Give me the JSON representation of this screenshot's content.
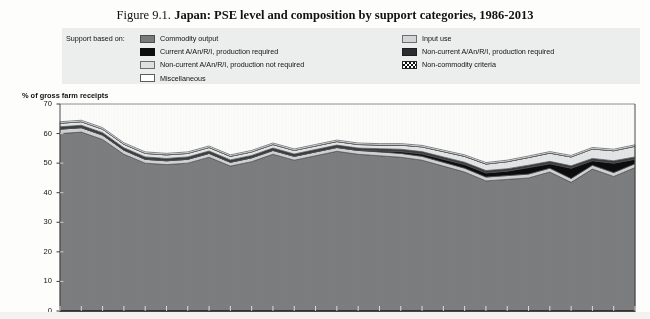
{
  "title": {
    "figure_number": "Figure 9.1.",
    "text": "Japan: PSE level and composition by support categories, 1986-2013"
  },
  "legend": {
    "lead_label": "Support based on:",
    "left_items": [
      {
        "label": "Commodity output",
        "swatch": "dark-gray-fill",
        "color": "#77797a"
      },
      {
        "label": "Current A/An/R/I, production required",
        "swatch": "black-fill",
        "color": "#0d0d0d"
      },
      {
        "label": "Non-current A/An/R/I, production not required",
        "swatch": "light-gray-fill",
        "color": "#dedfe0"
      },
      {
        "label": "Miscellaneous",
        "swatch": "white-fill",
        "color": "#ffffff"
      }
    ],
    "right_items": [
      {
        "label": "Input use",
        "swatch": "light-gray-fill",
        "color": "#d3d5d6"
      },
      {
        "label": "Non-current A/An/R/I, production required",
        "swatch": "very-dark-fill",
        "color": "#2b2d2e"
      },
      {
        "label": "Non-commodity criteria",
        "swatch": "hatched-fill",
        "color": "#ffffff"
      }
    ]
  },
  "axis": {
    "y_label": "% of gross farm receipts",
    "y_ticks": [
      "70",
      "60",
      "50",
      "40",
      "30",
      "20",
      "10",
      "0"
    ]
  },
  "chart_data": {
    "type": "area",
    "title": "Japan: PSE level and composition by support categories, 1986-2013",
    "xlabel": "",
    "ylabel": "% of gross farm receipts",
    "ylim": [
      0,
      70
    ],
    "grid": false,
    "legend_position": "top",
    "stacked": true,
    "x": [
      1986,
      1987,
      1988,
      1989,
      1990,
      1991,
      1992,
      1993,
      1994,
      1995,
      1996,
      1997,
      1998,
      1999,
      2000,
      2001,
      2002,
      2003,
      2004,
      2005,
      2006,
      2007,
      2008,
      2009,
      2010,
      2011,
      2012,
      2013
    ],
    "series": [
      {
        "name": "Commodity output",
        "values": [
          60.0,
          60.5,
          58.0,
          53.0,
          50.0,
          49.5,
          50.0,
          52.0,
          49.0,
          50.5,
          53.0,
          51.0,
          52.5,
          54.0,
          53.0,
          52.5,
          52.0,
          51.0,
          49.0,
          47.0,
          44.0,
          44.5,
          45.0,
          47.0,
          43.5,
          48.0,
          45.5,
          48.5
        ]
      },
      {
        "name": "Input use",
        "values": [
          1.5,
          1.5,
          1.5,
          1.4,
          1.3,
          1.3,
          1.3,
          1.3,
          1.3,
          1.3,
          1.3,
          1.3,
          1.3,
          1.3,
          1.3,
          1.3,
          1.3,
          1.3,
          1.3,
          1.3,
          1.3,
          1.3,
          1.3,
          1.3,
          1.3,
          1.3,
          1.3,
          1.3
        ]
      },
      {
        "name": "Current A/An/R/I, production required",
        "values": [
          0.0,
          0.0,
          0.0,
          0.0,
          0.0,
          0.0,
          0.0,
          0.0,
          0.0,
          0.0,
          0.0,
          0.0,
          0.0,
          0.0,
          0.0,
          0.3,
          0.6,
          0.8,
          1.0,
          1.2,
          1.4,
          1.5,
          2.2,
          1.5,
          3.5,
          1.5,
          3.2,
          1.5
        ]
      },
      {
        "name": "Non-current A/An/R/I, production required",
        "values": [
          0.8,
          0.8,
          0.8,
          0.8,
          0.8,
          0.8,
          0.8,
          0.8,
          0.8,
          0.8,
          0.8,
          0.8,
          0.8,
          0.8,
          0.8,
          0.8,
          0.8,
          0.8,
          0.8,
          0.8,
          0.8,
          0.8,
          0.8,
          0.8,
          0.8,
          0.8,
          0.8,
          0.8
        ]
      },
      {
        "name": "Non-current A/An/R/I, production not required",
        "values": [
          1.2,
          1.2,
          1.2,
          1.2,
          1.2,
          1.2,
          1.2,
          1.2,
          1.2,
          1.2,
          1.2,
          1.2,
          1.2,
          1.2,
          1.2,
          1.2,
          1.4,
          1.6,
          1.8,
          2.0,
          2.2,
          2.4,
          2.6,
          2.8,
          3.0,
          3.2,
          3.4,
          3.6
        ]
      },
      {
        "name": "Non-commodity criteria",
        "values": [
          0.0,
          0.0,
          0.0,
          0.0,
          0.0,
          0.0,
          0.0,
          0.0,
          0.0,
          0.0,
          0.0,
          0.0,
          0.0,
          0.0,
          0.0,
          0.0,
          0.0,
          0.0,
          0.0,
          0.0,
          0.0,
          0.0,
          0.0,
          0.0,
          0.0,
          0.0,
          0.0,
          0.0
        ]
      },
      {
        "name": "Miscellaneous",
        "values": [
          0.5,
          0.5,
          0.5,
          0.5,
          0.5,
          0.5,
          0.5,
          0.5,
          0.5,
          0.5,
          0.5,
          0.5,
          0.5,
          0.5,
          0.5,
          0.5,
          0.5,
          0.5,
          0.5,
          0.5,
          0.5,
          0.5,
          0.5,
          0.5,
          0.5,
          0.5,
          0.5,
          0.5
        ]
      }
    ],
    "total_pse": [
      64.0,
      64.5,
      62.0,
      56.9,
      53.8,
      53.3,
      53.8,
      55.8,
      52.8,
      54.3,
      56.8,
      54.8,
      56.3,
      57.8,
      56.8,
      56.6,
      56.6,
      56.0,
      54.4,
      52.8,
      50.2,
      51.0,
      52.4,
      53.9,
      52.6,
      55.3,
      54.7,
      56.2
    ],
    "colors": {
      "commodity_output": "#77797a",
      "input_use": "#d3d5d6",
      "current_required": "#0d0d0d",
      "noncurrent_required": "#2b2d2e",
      "noncurrent_not_required": "#dedfe0",
      "noncommodity": "#ffffff",
      "miscellaneous": "#ffffff"
    }
  }
}
